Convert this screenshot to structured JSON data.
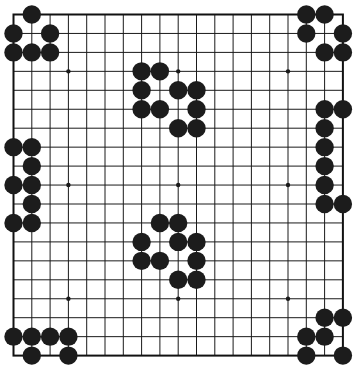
{
  "board": {
    "size": 19,
    "origin_x": 13.5,
    "origin_y": 14.5,
    "spacing_x": 18.3,
    "spacing_y": 18.95,
    "stone_radius": 9.2,
    "hoshi_radius": 2.2,
    "line_color": "#1a1a1a",
    "border_color": "#111111",
    "background": "#ffffff",
    "stone_color": "#1c1c1c",
    "hoshi": [
      [
        3,
        3
      ],
      [
        9,
        3
      ],
      [
        15,
        3
      ],
      [
        3,
        9
      ],
      [
        9,
        9
      ],
      [
        15,
        9
      ],
      [
        3,
        15
      ],
      [
        9,
        15
      ],
      [
        15,
        15
      ]
    ],
    "stones": {
      "top_left": [
        [
          1,
          0
        ],
        [
          0,
          1
        ],
        [
          2,
          1
        ],
        [
          0,
          2
        ],
        [
          1,
          2
        ],
        [
          2,
          2
        ]
      ],
      "top_center": [
        [
          7,
          3
        ],
        [
          8,
          3
        ],
        [
          7,
          4
        ],
        [
          9,
          4
        ],
        [
          10,
          4
        ],
        [
          7,
          5
        ],
        [
          8,
          5
        ],
        [
          10,
          5
        ],
        [
          9,
          6
        ],
        [
          10,
          6
        ]
      ],
      "top_right": [
        [
          16,
          0
        ],
        [
          17,
          0
        ],
        [
          16,
          1
        ],
        [
          18,
          1
        ],
        [
          17,
          2
        ],
        [
          18,
          2
        ]
      ],
      "right_side": [
        [
          17,
          5
        ],
        [
          18,
          5
        ],
        [
          17,
          6
        ],
        [
          17,
          7
        ],
        [
          17,
          8
        ],
        [
          17,
          9
        ],
        [
          17,
          10
        ],
        [
          18,
          10
        ]
      ],
      "left_side": [
        [
          0,
          7
        ],
        [
          1,
          7
        ],
        [
          1,
          8
        ],
        [
          0,
          9
        ],
        [
          1,
          9
        ],
        [
          1,
          10
        ],
        [
          0,
          11
        ],
        [
          1,
          11
        ]
      ],
      "center": [
        [
          8,
          11
        ],
        [
          9,
          11
        ],
        [
          7,
          12
        ],
        [
          9,
          12
        ],
        [
          10,
          12
        ],
        [
          7,
          13
        ],
        [
          8,
          13
        ],
        [
          10,
          13
        ],
        [
          9,
          14
        ],
        [
          10,
          14
        ]
      ],
      "bottom_left": [
        [
          0,
          17
        ],
        [
          1,
          17
        ],
        [
          2,
          17
        ],
        [
          3,
          17
        ],
        [
          1,
          18
        ],
        [
          3,
          18
        ]
      ],
      "bottom_right": [
        [
          17,
          16
        ],
        [
          18,
          16
        ],
        [
          16,
          17
        ],
        [
          17,
          17
        ],
        [
          16,
          18
        ],
        [
          18,
          18
        ]
      ]
    }
  }
}
